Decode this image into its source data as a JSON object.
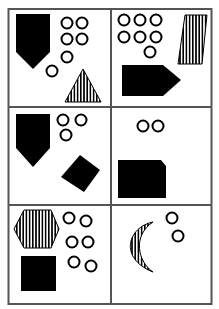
{
  "puzzle": {
    "grid": {
      "rows": 3,
      "cols": 2,
      "border_color": "#555555",
      "fill_color": "#000000"
    },
    "cells": [
      {
        "row": 0,
        "col": 0,
        "shapes": [
          {
            "type": "pentagon-shield",
            "fill": "solid"
          },
          {
            "type": "circle-group",
            "count": 6
          },
          {
            "type": "triangle",
            "fill": "vertical-stripes"
          }
        ]
      },
      {
        "row": 0,
        "col": 1,
        "shapes": [
          {
            "type": "circle-group",
            "count": 7
          },
          {
            "type": "parallelogram",
            "fill": "vertical-stripes"
          },
          {
            "type": "arrow-pentagon",
            "fill": "solid"
          }
        ]
      },
      {
        "row": 1,
        "col": 0,
        "shapes": [
          {
            "type": "pentagon-shield",
            "fill": "solid"
          },
          {
            "type": "circle-group",
            "count": 3
          },
          {
            "type": "rotated-square",
            "fill": "solid"
          }
        ]
      },
      {
        "row": 1,
        "col": 1,
        "shapes": [
          {
            "type": "circle-group",
            "count": 2
          },
          {
            "type": "clipped-rectangle",
            "fill": "solid"
          }
        ]
      },
      {
        "row": 2,
        "col": 0,
        "shapes": [
          {
            "type": "hexagon",
            "fill": "vertical-stripes"
          },
          {
            "type": "circle-group",
            "count": 6
          },
          {
            "type": "square",
            "fill": "solid"
          }
        ]
      },
      {
        "row": 2,
        "col": 1,
        "shapes": [
          {
            "type": "crescent",
            "fill": "vertical-stripes"
          },
          {
            "type": "circle-group",
            "count": 2
          }
        ]
      }
    ]
  }
}
